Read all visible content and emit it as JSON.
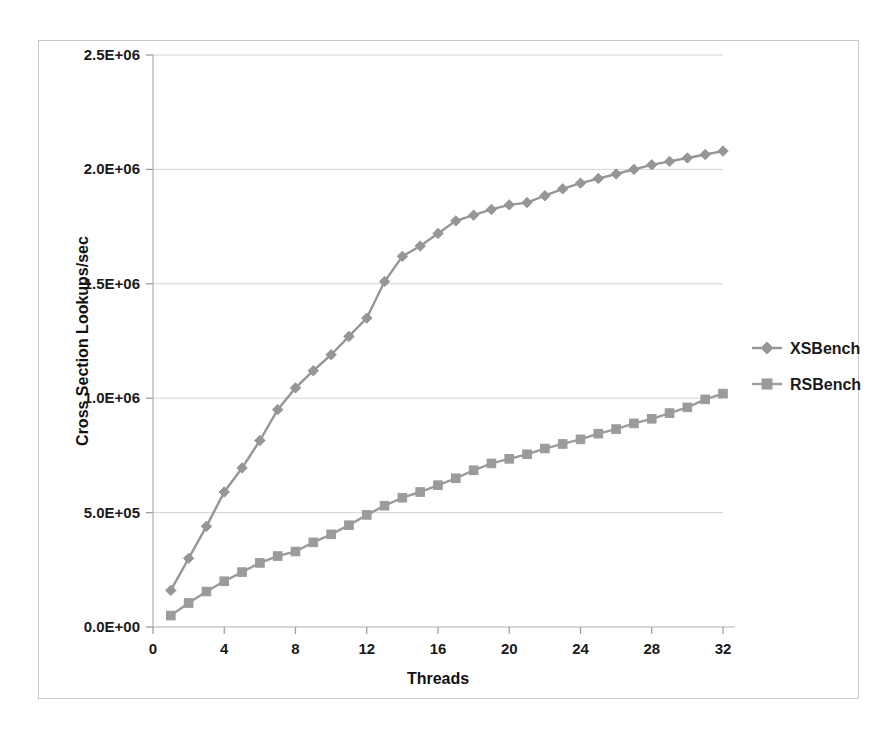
{
  "chart_data": {
    "type": "line",
    "title": "",
    "xlabel": "Threads",
    "ylabel": "Cross Section Lookups/sec",
    "xlim": [
      0,
      32
    ],
    "ylim": [
      0,
      2500000
    ],
    "grid": true,
    "legend_position": "right",
    "x_ticks": [
      "0",
      "4",
      "8",
      "12",
      "16",
      "20",
      "24",
      "28",
      "32"
    ],
    "x_tick_values": [
      0,
      4,
      8,
      12,
      16,
      20,
      24,
      28,
      32
    ],
    "y_ticks": [
      "0.0E+00",
      "5.0E+05",
      "1.0E+06",
      "1.5E+06",
      "2.0E+06",
      "2.5E+06"
    ],
    "y_tick_values": [
      0,
      500000,
      1000000,
      1500000,
      2000000,
      2500000
    ],
    "x": [
      1,
      2,
      3,
      4,
      5,
      6,
      7,
      8,
      9,
      10,
      11,
      12,
      13,
      14,
      15,
      16,
      17,
      18,
      19,
      20,
      21,
      22,
      23,
      24,
      25,
      26,
      27,
      28,
      29,
      30,
      31,
      32
    ],
    "series": [
      {
        "name": "XSBench",
        "marker": "diamond",
        "color": "#969696",
        "values": [
          160000,
          300000,
          440000,
          590000,
          695000,
          815000,
          950000,
          1045000,
          1120000,
          1190000,
          1270000,
          1350000,
          1510000,
          1620000,
          1665000,
          1720000,
          1775000,
          1800000,
          1825000,
          1845000,
          1855000,
          1885000,
          1915000,
          1940000,
          1960000,
          1980000,
          2000000,
          2020000,
          2035000,
          2050000,
          2065000,
          2080000
        ]
      },
      {
        "name": "RSBench",
        "marker": "square",
        "color": "#9b9b9b",
        "values": [
          50000,
          105000,
          155000,
          200000,
          240000,
          280000,
          310000,
          330000,
          370000,
          405000,
          445000,
          490000,
          530000,
          565000,
          590000,
          620000,
          650000,
          685000,
          715000,
          735000,
          755000,
          780000,
          800000,
          820000,
          845000,
          865000,
          890000,
          910000,
          935000,
          960000,
          995000,
          1020000
        ]
      }
    ]
  },
  "axes": {
    "x_title": "Threads",
    "y_title": "Cross Section Lookups/sec"
  },
  "legend": {
    "items": [
      {
        "label": "XSBench",
        "color": "#969696",
        "marker": "diamond"
      },
      {
        "label": "RSBench",
        "color": "#9b9b9b",
        "marker": "square"
      }
    ]
  }
}
